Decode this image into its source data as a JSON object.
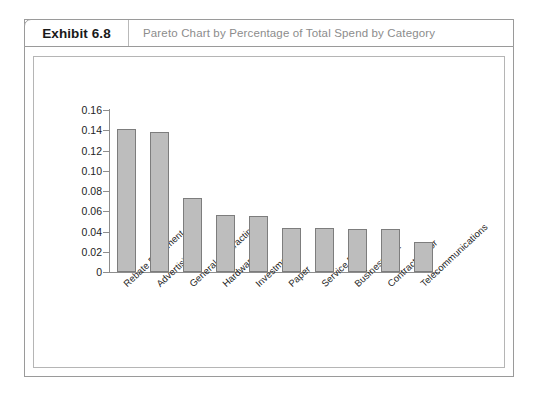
{
  "exhibit": {
    "tag": "Exhibit 6.8",
    "title": "Pareto Chart by Percentage of Total Spend by Category"
  },
  "chart_data": {
    "type": "bar",
    "title": "Pareto Chart by Percentage of Total Spend by Category",
    "xlabel": "",
    "ylabel": "",
    "ylim": [
      0,
      0.16
    ],
    "grid": false,
    "legend": false,
    "ytick_labels": [
      "0.16",
      "0.14",
      "0.12",
      "0.10",
      "0.08",
      "0.06",
      "0.04",
      "0.02",
      "0"
    ],
    "yticks": [
      0.16,
      0.14,
      0.12,
      0.1,
      0.08,
      0.06,
      0.04,
      0.02,
      0
    ],
    "categories": [
      "Rebate Fulfillment & ...",
      "Advertising",
      "General Contracting",
      "Hardware",
      "Investments",
      "Paper",
      "Service Parts",
      "Business & ...",
      "Contract Labor",
      "Telecommunications"
    ],
    "values": [
      0.141,
      0.138,
      0.073,
      0.056,
      0.055,
      0.043,
      0.043,
      0.042,
      0.042,
      0.03
    ],
    "bar_fill": "#bdbdbd",
    "bar_border": "#7d7d7d",
    "axis_color": "#8d8d8d"
  }
}
